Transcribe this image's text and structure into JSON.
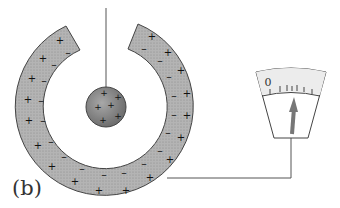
{
  "figure": {
    "panel_label": "(b)",
    "sphere_charges": [
      "+",
      "+",
      "+",
      "+",
      "+",
      "+"
    ],
    "shell_outer_charges": "+",
    "shell_inner_charges": "-",
    "electrometer": {
      "zero_label": "0",
      "tick_count": 7,
      "needle_direction": "up"
    },
    "colors": {
      "shell_fill": "#aaaaaa",
      "sphere_fill": "#8e8e8e",
      "stroke": "#444444",
      "needle": "#777777",
      "dial_top": "#f0f0f0"
    }
  }
}
